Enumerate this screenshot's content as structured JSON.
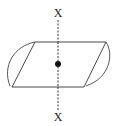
{
  "diagram": {
    "axis": {
      "top_label": "X",
      "bottom_label": "X",
      "style": "dashed"
    },
    "center_point": {
      "shape": "filled-circle"
    },
    "colors": {
      "stroke": "#333333",
      "background": "#ffffff"
    }
  }
}
